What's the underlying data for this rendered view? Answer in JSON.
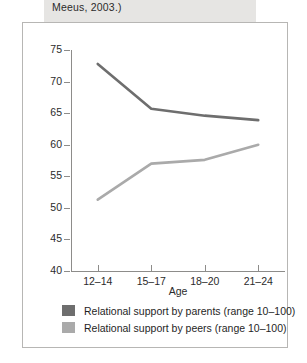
{
  "caption": {
    "text": "Meeus, 2003.)"
  },
  "chart_data": {
    "type": "line",
    "title": "",
    "xlabel": "Age",
    "ylabel": "Perceived support",
    "categories": [
      "12–14",
      "15–17",
      "18–20",
      "21–24"
    ],
    "ylim": [
      40,
      75
    ],
    "yticks": [
      75,
      70,
      65,
      60,
      55,
      50,
      45,
      40
    ],
    "grid": false,
    "legend_position": "bottom",
    "series": [
      {
        "name": "Relational support by parents (range 10–100)",
        "color": "#6e6e6e",
        "values": [
          72.8,
          65.7,
          64.6,
          63.9
        ]
      },
      {
        "name": "Relational support by peers (range 10–100)",
        "color": "#aaaaaa",
        "values": [
          51.3,
          57.0,
          57.6,
          60.0
        ]
      }
    ]
  },
  "legend": {
    "items": [
      {
        "label": "Relational support by parents (range 10–100)",
        "color": "#6e6e6e"
      },
      {
        "label": "Relational support by peers (range 10–100)",
        "color": "#aaaaaa"
      }
    ]
  }
}
